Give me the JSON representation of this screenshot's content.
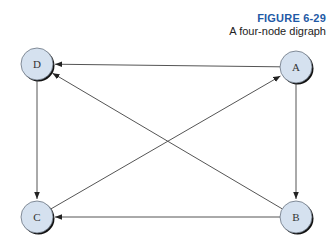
{
  "caption": {
    "figure_number": "FIGURE 6-29",
    "title": "A four-node digraph"
  },
  "colors": {
    "node_fill": "#d5e1ef",
    "node_stroke": "#1a1a1a",
    "edge": "#555555",
    "figure_number": "#1f5aa6"
  },
  "nodes": [
    {
      "id": "D",
      "label": "D",
      "x": 37,
      "y": 64
    },
    {
      "id": "A",
      "label": "A",
      "x": 296,
      "y": 67
    },
    {
      "id": "C",
      "label": "C",
      "x": 37,
      "y": 217
    },
    {
      "id": "B",
      "label": "B",
      "x": 296,
      "y": 217
    }
  ],
  "edges": [
    {
      "from": "A",
      "to": "D"
    },
    {
      "from": "B",
      "to": "D"
    },
    {
      "from": "D",
      "to": "C"
    },
    {
      "from": "A",
      "to": "B"
    },
    {
      "from": "C",
      "to": "A"
    },
    {
      "from": "B",
      "to": "C"
    }
  ]
}
